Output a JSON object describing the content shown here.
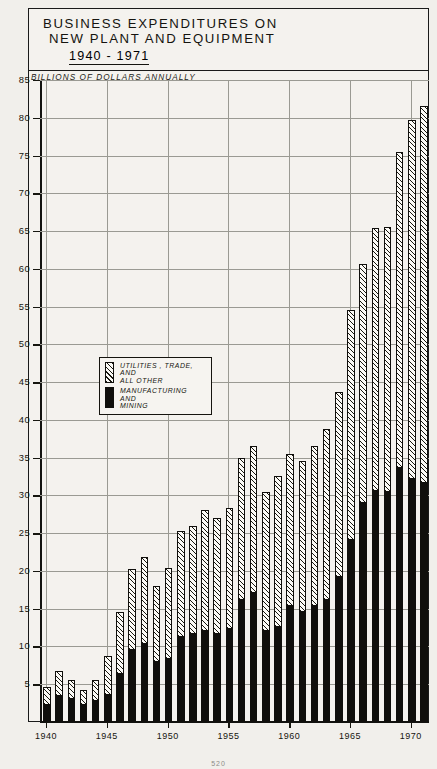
{
  "title": {
    "line1": "BUSINESS  EXPENDITURES ON",
    "line2": "NEW  PLANT AND EQUIPMENT",
    "years": "1940 - 1971"
  },
  "subtitle": "BILLIONS OF DOLLARS ANNUALLY",
  "legend": {
    "items": [
      {
        "swatch": "hatched",
        "lines": [
          "UTILITIES , TRADE,",
          "AND",
          "ALL OTHER"
        ]
      },
      {
        "swatch": "solid",
        "lines": [
          "MANUFACTURING",
          "AND",
          "MINING"
        ]
      }
    ]
  },
  "footer": {
    "page": "520"
  },
  "colors": {
    "ink": "#100f0c",
    "paper": "#f1efeb",
    "grid": "#9a9a93",
    "hatch_fill": "#fbfaf6"
  },
  "chart_data": {
    "type": "bar",
    "subtype": "stacked-vertical",
    "xlabel": "",
    "ylabel": "BILLIONS OF DOLLARS ANNUALLY",
    "ylim": [
      0,
      85
    ],
    "ytick_step": 5,
    "yticks": [
      5,
      10,
      15,
      20,
      25,
      30,
      35,
      40,
      45,
      50,
      55,
      60,
      65,
      70,
      75,
      80,
      85
    ],
    "grid": true,
    "legend_position": "inside-left-middle",
    "x_tick_labels": [
      "1940",
      "1945",
      "1950",
      "1955",
      "1960",
      "1965",
      "1970"
    ],
    "categories": [
      "1940",
      "1941",
      "1942",
      "1943",
      "1944",
      "1945",
      "1946",
      "1947",
      "1948",
      "1949",
      "1950",
      "1951",
      "1952",
      "1953",
      "1954",
      "1955",
      "1956",
      "1957",
      "1958",
      "1959",
      "1960",
      "1961",
      "1962",
      "1963",
      "1964",
      "1965",
      "1966",
      "1967",
      "1968",
      "1969",
      "1970",
      "1971"
    ],
    "series": [
      {
        "name": "MANUFACTURING AND MINING",
        "fill": "solid-black",
        "values": [
          2.3,
          3.4,
          3.0,
          2.2,
          2.8,
          3.6,
          6.3,
          9.6,
          10.3,
          8.0,
          8.3,
          11.2,
          11.6,
          12.1,
          11.7,
          12.3,
          16.2,
          17.1,
          12.0,
          12.6,
          15.3,
          14.5,
          15.4,
          16.2,
          19.2,
          24.1,
          29.0,
          30.6,
          30.5,
          33.6,
          32.2,
          31.7
        ]
      },
      {
        "name": "UTILITIES, TRADE, AND ALL OTHER",
        "fill": "diagonal-hatch",
        "values": [
          2.4,
          3.4,
          2.6,
          2.0,
          2.8,
          5.1,
          8.3,
          10.7,
          11.5,
          10.0,
          12.1,
          14.1,
          14.4,
          16.0,
          15.3,
          16.1,
          18.8,
          19.5,
          18.5,
          20.0,
          20.2,
          20.0,
          21.1,
          22.6,
          24.5,
          30.4,
          31.7,
          34.8,
          35.0,
          41.9,
          47.5,
          49.8
        ]
      }
    ],
    "totals": [
      4.7,
      6.8,
      5.6,
      4.2,
      5.6,
      8.7,
      14.6,
      20.3,
      21.8,
      18.0,
      20.4,
      25.3,
      26.0,
      28.1,
      27.0,
      28.4,
      35.0,
      36.6,
      30.5,
      32.6,
      35.5,
      34.5,
      36.5,
      38.8,
      43.7,
      54.5,
      60.7,
      65.4,
      65.5,
      75.5,
      79.7,
      81.5
    ]
  }
}
